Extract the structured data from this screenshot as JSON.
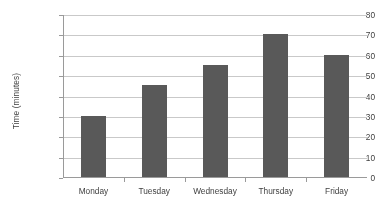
{
  "chart_data": {
    "type": "bar",
    "title": "",
    "subtitle": "",
    "xlabel": "",
    "ylabel": "Time (minutes)",
    "categories": [
      "Monday",
      "Tuesday",
      "Wednesday",
      "Thursday",
      "Friday"
    ],
    "values": [
      30,
      45,
      55,
      70,
      60
    ],
    "ylim": [
      0,
      80
    ],
    "ytick_labels": [
      "0",
      "10",
      "20",
      "30",
      "40",
      "50",
      "60",
      "70",
      "80"
    ],
    "ytick_values": [
      0,
      10,
      20,
      30,
      40,
      50,
      60,
      70,
      80
    ],
    "grid": "horizontal",
    "legend": "none",
    "bar_color": "#595959",
    "gridline_color": "#c9c9c9",
    "axis_color": "#9a9a9a",
    "background_color": "#ffffff"
  }
}
